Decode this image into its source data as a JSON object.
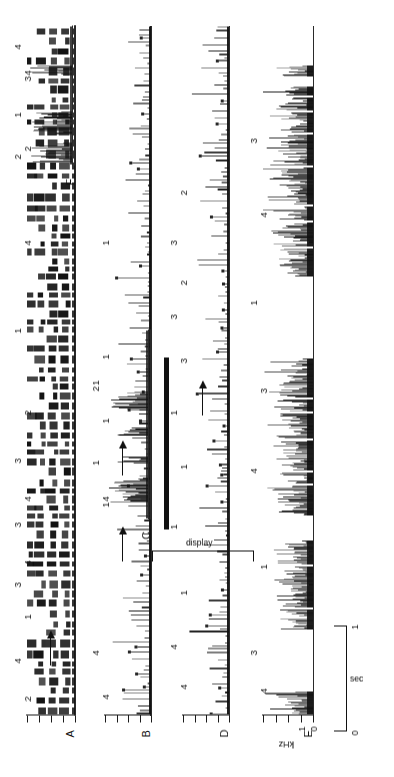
{
  "figure": {
    "type": "spectrogram-series",
    "panel_count": 6,
    "rotation_deg": -90,
    "ink_color": "#111111",
    "background_color": "#ffffff"
  },
  "axes": {
    "frequency": {
      "label": "kHz",
      "tick_labels": [
        "0",
        "1"
      ],
      "tick_count": 5,
      "unit": "kHz"
    },
    "time": {
      "scalebar_label": "sec",
      "scalebar_start": "0",
      "scalebar_end": "1",
      "unit": "sec"
    }
  },
  "panels": [
    {
      "letter": "A",
      "annotations": [
        "2",
        "4",
        "1",
        "3",
        "4",
        "3",
        "4",
        "3",
        "2",
        "1",
        "4",
        "2",
        "4"
      ],
      "arrow_labels": [
        "4",
        "3"
      ],
      "has_arrow": true
    },
    {
      "letter": "B",
      "annotations": [
        "4",
        "4",
        "1",
        "1",
        "1"
      ],
      "arrow_labels": [
        "1"
      ],
      "has_arrow": true,
      "bracket_label": "display"
    },
    {
      "letter": "C",
      "annotations": [
        "4",
        "1",
        "1",
        "2",
        "1"
      ],
      "arrow_labels": [
        "1"
      ],
      "has_arrow": true
    },
    {
      "letter": "D",
      "annotations": [
        "4",
        "4",
        "1",
        "1",
        "1",
        "1",
        "3",
        "3",
        "2",
        "3",
        "2"
      ],
      "arrow_labels": [
        "3"
      ],
      "has_arrow": true
    },
    {
      "letter": "E",
      "annotations": [
        "4",
        "3",
        "1",
        "4",
        "3",
        "1",
        "4",
        "3"
      ],
      "arrow_labels": [],
      "has_arrow": false
    },
    {
      "letter": "F",
      "annotations": [
        "2",
        "1",
        "3",
        "4"
      ],
      "arrow_labels": [],
      "has_arrow": false
    }
  ],
  "chart_data": {
    "type": "heatmap",
    "title": "",
    "xlabel": "sec",
    "ylabel": "kHz",
    "ylim": [
      0,
      5
    ],
    "xlim": [
      0,
      1
    ],
    "grid": false,
    "legend_position": "none",
    "series": [
      {
        "name": "A",
        "values": []
      },
      {
        "name": "B",
        "values": []
      },
      {
        "name": "C",
        "values": []
      },
      {
        "name": "D",
        "values": []
      },
      {
        "name": "E",
        "values": []
      },
      {
        "name": "F",
        "values": []
      }
    ]
  }
}
